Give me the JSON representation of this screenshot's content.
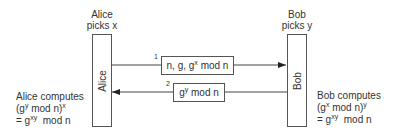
{
  "alice": {
    "header_line1": "Alice",
    "header_line2": "picks x",
    "box_label": "Alice",
    "computes_line1": "Alice computes",
    "computes_line2_base": "(g",
    "computes_line2_sup1": "y",
    "computes_line2_mid": " mod n)",
    "computes_line2_sup2": "x",
    "computes_line3_base": "= g",
    "computes_line3_sup": "xy",
    "computes_line3_tail": "  mod n"
  },
  "bob": {
    "header_line1": "Bob",
    "header_line2": "picks y",
    "box_label": "Bob",
    "computes_line1": "Bob computes",
    "computes_line2_base": "(g",
    "computes_line2_sup1": "x",
    "computes_line2_mid": " mod n)",
    "computes_line2_sup2": "y",
    "computes_line3_base": "= g",
    "computes_line3_sup": "xy",
    "computes_line3_tail": "  mod n"
  },
  "messages": [
    {
      "number": "1",
      "direction": "alice-to-bob",
      "text_pre": "n, g, g",
      "text_sup": "x",
      "text_post": " mod n"
    },
    {
      "number": "2",
      "direction": "bob-to-alice",
      "text_pre": "g",
      "text_sup": "y",
      "text_post": " mod n"
    }
  ],
  "colors": {
    "line": "#333333",
    "text": "#333333",
    "background": "#ffffff"
  }
}
